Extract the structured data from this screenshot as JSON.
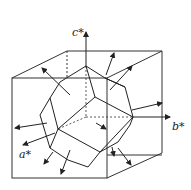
{
  "diagram": {
    "type": "crystal-polyhedron-in-reciprocal-lattice-box",
    "axes": [
      {
        "name": "c-star-axis",
        "label": "c*"
      },
      {
        "name": "b-star-axis",
        "label": "b*"
      },
      {
        "name": "a-star-axis",
        "label": "a*"
      }
    ],
    "colors": {
      "line": "#222222",
      "background": "#ffffff"
    }
  }
}
